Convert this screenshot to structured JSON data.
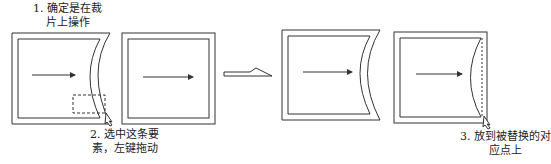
{
  "diagram": {
    "type": "process-steps",
    "stroke_color": "#333333",
    "background": "#ffffff",
    "panels": [
      {
        "id": "panel-1",
        "description": "Frame with curved right edge, selection box on lower right edge, cursor"
      },
      {
        "id": "panel-2",
        "description": "Rectangular frame with arrow"
      },
      {
        "id": "panel-3",
        "description": "Result frame with curved right edge"
      },
      {
        "id": "panel-4",
        "description": "Rectangular frame with curved inner edge, dashed target line, cursor"
      }
    ],
    "steps": [
      {
        "number": "1.",
        "line1": "1. 确定是在裁",
        "line2": "片上操作"
      },
      {
        "number": "2.",
        "line1": "2. 选中这条要",
        "line2": "素，左键拖动"
      },
      {
        "number": "3.",
        "line1": "3. 放到被替换的对",
        "line2": "应点上"
      }
    ],
    "transition_arrow": "hollow-arrow-right"
  }
}
